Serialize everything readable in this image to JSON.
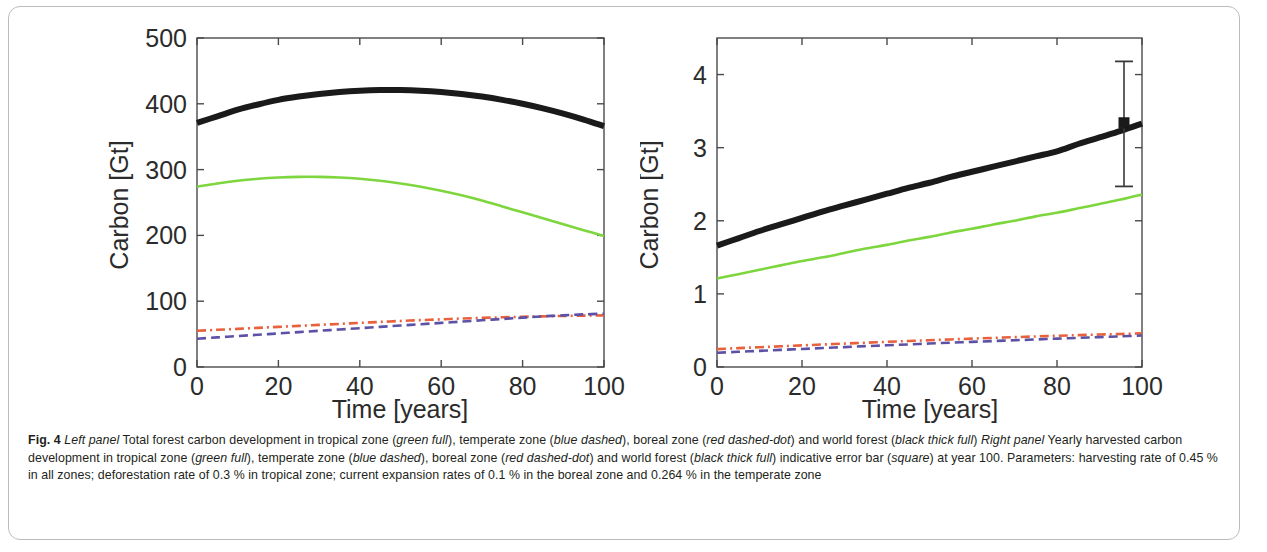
{
  "figure": {
    "label": "Fig. 4",
    "caption_segments": [
      {
        "text": "Fig. 4 ",
        "style": "bold"
      },
      {
        "text": "Left panel",
        "style": "italic"
      },
      {
        "text": " Total forest carbon development in tropical zone (",
        "style": "normal"
      },
      {
        "text": "green full",
        "style": "italic"
      },
      {
        "text": "), temperate zone (",
        "style": "normal"
      },
      {
        "text": "blue dashed",
        "style": "italic"
      },
      {
        "text": "), boreal zone (",
        "style": "normal"
      },
      {
        "text": "red dashed-dot",
        "style": "italic"
      },
      {
        "text": ") and world forest (",
        "style": "normal"
      },
      {
        "text": "black thick full",
        "style": "italic"
      },
      {
        "text": ") ",
        "style": "normal"
      },
      {
        "text": "Right panel",
        "style": "italic"
      },
      {
        "text": " Yearly harvested carbon development in tropical zone (",
        "style": "normal"
      },
      {
        "text": "green full",
        "style": "italic"
      },
      {
        "text": "), temperate zone (",
        "style": "normal"
      },
      {
        "text": "blue dashed",
        "style": "italic"
      },
      {
        "text": "), boreal zone (",
        "style": "normal"
      },
      {
        "text": "red dashed-dot",
        "style": "italic"
      },
      {
        "text": ") and world forest (",
        "style": "normal"
      },
      {
        "text": "black thick full",
        "style": "italic"
      },
      {
        "text": ") indicative error bar (",
        "style": "normal"
      },
      {
        "text": "square",
        "style": "italic"
      },
      {
        "text": ") at year 100. Parameters: harvesting rate of 0.45 % in all zones; deforestation rate of 0.3 % in tropical zone; current expansion rates of 0.1 % in the boreal zone and 0.264 % in the temperate zone",
        "style": "normal"
      }
    ]
  },
  "colors": {
    "tropical_green": "#7ed63e",
    "temperate_blue": "#5b51a6",
    "boreal_red": "#e8603c",
    "world_black": "#1a1a1a",
    "axis": "#2b2b2b",
    "frame_border": "#b9bcbe"
  },
  "chart_data": [
    {
      "type": "line",
      "panel": "left",
      "title": "",
      "xlabel": "Time   [years]",
      "ylabel": "Carbon [Gt]",
      "xlim": [
        0,
        100
      ],
      "ylim": [
        0,
        500
      ],
      "xticks": [
        0,
        20,
        40,
        60,
        80,
        100
      ],
      "yticks": [
        0,
        100,
        200,
        300,
        400,
        500
      ],
      "xticklabels": [
        "0",
        "20",
        "40",
        "60",
        "80",
        "100"
      ],
      "yticklabels": [
        "0",
        "100",
        "200",
        "300",
        "400",
        "500"
      ],
      "grid": false,
      "legend": "none",
      "x": [
        0,
        5,
        10,
        15,
        20,
        25,
        30,
        35,
        40,
        45,
        50,
        55,
        60,
        65,
        70,
        75,
        80,
        85,
        90,
        95,
        100
      ],
      "series": [
        {
          "name": "world forest",
          "style": "black thick full",
          "color": "#1a1a1a",
          "values": [
            371,
            381,
            391,
            399,
            406,
            411,
            415,
            418,
            420,
            421,
            421,
            420,
            418,
            415,
            411,
            406,
            400,
            393,
            385,
            376,
            366
          ]
        },
        {
          "name": "tropical zone",
          "style": "green full",
          "color": "#7ed63e",
          "values": [
            274,
            279,
            283,
            286,
            288,
            289,
            289,
            288,
            286,
            283,
            279,
            274,
            268,
            261,
            253,
            244,
            235,
            226,
            217,
            208,
            199
          ]
        },
        {
          "name": "boreal zone",
          "style": "red dashed-dot",
          "color": "#e8603c",
          "values": [
            55,
            56.5,
            58,
            59.5,
            61,
            62.5,
            64,
            65.5,
            67,
            68.5,
            70,
            71.3,
            72.5,
            73.6,
            74.6,
            75.5,
            76.3,
            77,
            77.6,
            78.1,
            78.5
          ]
        },
        {
          "name": "temperate zone",
          "style": "blue dashed",
          "color": "#5b51a6",
          "values": [
            43,
            45,
            47,
            49,
            51,
            53,
            55,
            57,
            59,
            61,
            63,
            65,
            67,
            69,
            71,
            73,
            75,
            77,
            78.5,
            80,
            81
          ]
        }
      ]
    },
    {
      "type": "line",
      "panel": "right",
      "title": "",
      "xlabel": "Time   [years]",
      "ylabel": "Carbon [Gt]",
      "xlim": [
        0,
        100
      ],
      "ylim": [
        0,
        4.5
      ],
      "xticks": [
        0,
        20,
        40,
        60,
        80,
        100
      ],
      "yticks": [
        0,
        1,
        2,
        3,
        4
      ],
      "xticklabels": [
        "0",
        "20",
        "40",
        "60",
        "80",
        "100"
      ],
      "yticklabels": [
        "0",
        "1",
        "2",
        "3",
        "4"
      ],
      "grid": false,
      "legend": "none",
      "x": [
        0,
        5,
        10,
        15,
        20,
        25,
        30,
        35,
        40,
        45,
        50,
        55,
        60,
        65,
        70,
        75,
        80,
        85,
        90,
        95,
        100
      ],
      "series": [
        {
          "name": "world forest",
          "style": "black thick full",
          "color": "#1a1a1a",
          "values": [
            1.66,
            1.76,
            1.86,
            1.95,
            2.04,
            2.13,
            2.21,
            2.29,
            2.37,
            2.45,
            2.52,
            2.6,
            2.67,
            2.74,
            2.81,
            2.88,
            2.95,
            3.05,
            3.14,
            3.23,
            3.33
          ]
        },
        {
          "name": "tropical zone",
          "style": "green full",
          "color": "#7ed63e",
          "values": [
            1.21,
            1.27,
            1.33,
            1.39,
            1.45,
            1.5,
            1.56,
            1.62,
            1.67,
            1.73,
            1.78,
            1.84,
            1.89,
            1.95,
            2.0,
            2.06,
            2.11,
            2.17,
            2.23,
            2.29,
            2.36
          ]
        },
        {
          "name": "boreal zone",
          "style": "red dashed-dot",
          "color": "#e8603c",
          "values": [
            0.245,
            0.258,
            0.271,
            0.283,
            0.296,
            0.308,
            0.32,
            0.332,
            0.344,
            0.355,
            0.366,
            0.377,
            0.388,
            0.398,
            0.408,
            0.418,
            0.427,
            0.436,
            0.444,
            0.452,
            0.46
          ]
        },
        {
          "name": "temperate zone",
          "style": "blue dashed",
          "color": "#5b51a6",
          "values": [
            0.195,
            0.208,
            0.221,
            0.234,
            0.247,
            0.26,
            0.272,
            0.285,
            0.297,
            0.309,
            0.321,
            0.333,
            0.344,
            0.355,
            0.366,
            0.377,
            0.388,
            0.398,
            0.409,
            0.419,
            0.43
          ]
        }
      ],
      "errorbar": {
        "name": "indicative error bar",
        "marker": "square",
        "x": 100,
        "y": 3.34,
        "upper": 4.18,
        "lower": 2.47,
        "color": "#3a3a3a"
      }
    }
  ]
}
